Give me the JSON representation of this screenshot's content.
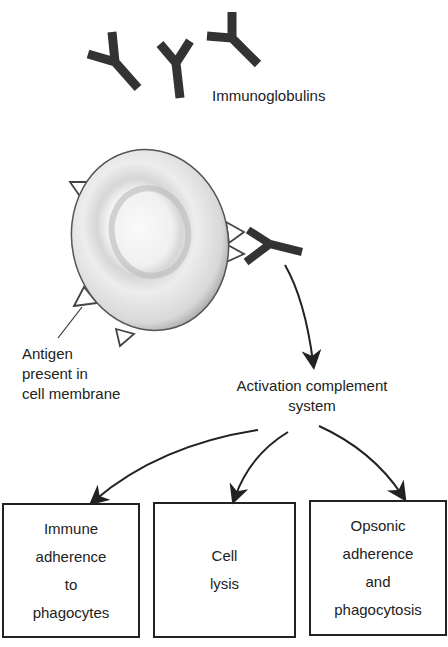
{
  "diagram": {
    "immunoglobulins_label": "Immunoglobulins",
    "antigen_label": [
      "Antigen",
      "present in",
      "cell membrane"
    ],
    "complement_label": [
      "Activation complement",
      "system"
    ],
    "outcomes": [
      {
        "lines": [
          "Immune",
          "adherence",
          "to",
          "phagocytes"
        ]
      },
      {
        "lines": [
          "Cell",
          "lysis"
        ]
      },
      {
        "lines": [
          "Opsonic",
          "adherence",
          "and",
          "phagocytosis"
        ]
      }
    ],
    "colors": {
      "ink": "#222222",
      "background": "#ffffff"
    }
  }
}
